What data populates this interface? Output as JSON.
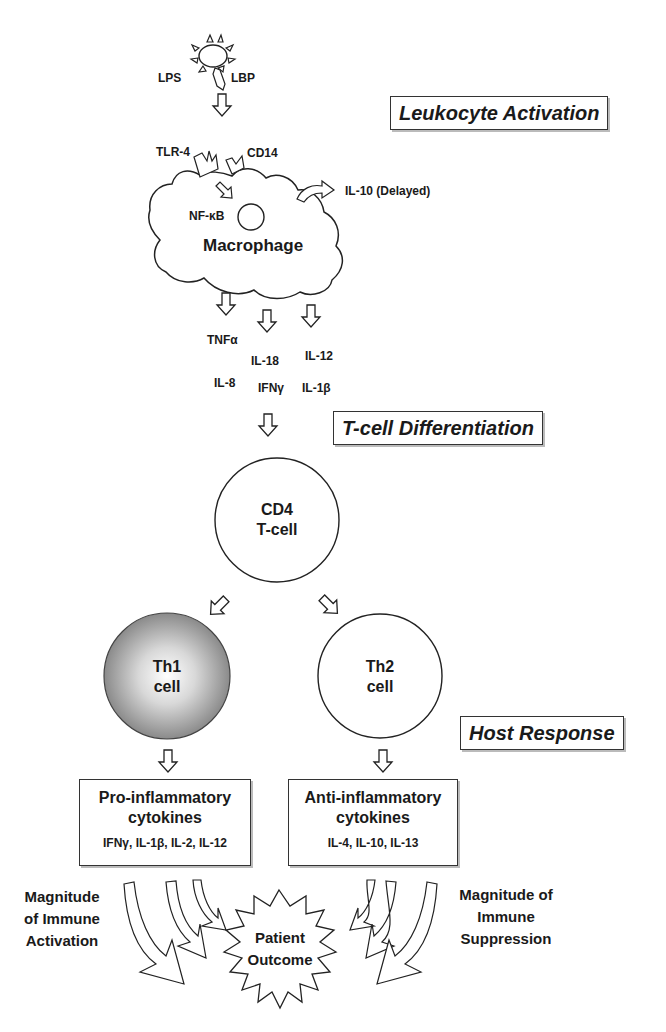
{
  "diagram": {
    "stages": {
      "leukocyte_activation": "Leukocyte Activation",
      "tcell_differentiation": "T-cell Differentiation",
      "host_response": "Host Response"
    },
    "pathogen": {
      "lps": "LPS",
      "lbp": "LBP"
    },
    "macrophage": {
      "receptor_tlr4": "TLR-4",
      "receptor_cd14": "CD14",
      "nfkb": "NF-κB",
      "label": "Macrophage",
      "delayed_output": "IL-10 (Delayed)"
    },
    "cytokines_released": {
      "tnfa": "TNFα",
      "il18": "IL-18",
      "il12": "IL-12",
      "il8": "IL-8",
      "ifng": "IFNγ",
      "il1b": "IL-1β"
    },
    "cd4": {
      "line1": "CD4",
      "line2": "T-cell"
    },
    "th1": {
      "line1": "Th1",
      "line2": "cell",
      "fill_color": "#9a9a9a"
    },
    "th2": {
      "line1": "Th2",
      "line2": "cell"
    },
    "pro_inflammatory": {
      "title_line1": "Pro-inflammatory",
      "title_line2": "cytokines",
      "list": "IFNγ, IL-1β, IL-2, IL-12"
    },
    "anti_inflammatory": {
      "title_line1": "Anti-inflammatory",
      "title_line2": "cytokines",
      "list": "IL-4, IL-10, IL-13"
    },
    "left_side": {
      "line1": "Magnitude",
      "line2": "of Immune",
      "line3": "Activation"
    },
    "right_side": {
      "line1": "Magnitude of",
      "line2": "Immune",
      "line3": "Suppression"
    },
    "outcome": {
      "line1": "Patient",
      "line2": "Outcome"
    }
  }
}
